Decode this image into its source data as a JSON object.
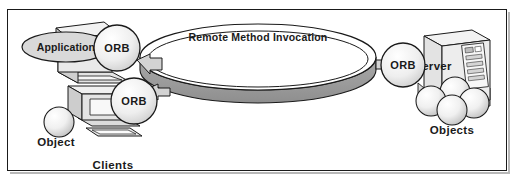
{
  "figure": {
    "title": "Remote Method Invocation",
    "border_color": "#1a1a1a",
    "background_color": "#ffffff",
    "shadow_color": "#b8b8b8"
  },
  "ring": {
    "label": "Remote Method Invocation",
    "top_fill": "#ffffff",
    "band_fill": "#9c9c9c",
    "stroke": "#1a1a1a"
  },
  "clients": {
    "group_label": "Clients",
    "application": {
      "label": "Application",
      "fill": "#d9d9d9",
      "stroke": "#1a1a1a"
    },
    "laptop_orb": {
      "label": "ORB",
      "fill": "#ececec",
      "stroke": "#1a1a1a"
    },
    "desktop_orb": {
      "label": "ORB",
      "fill": "#ececec",
      "stroke": "#1a1a1a"
    },
    "object": {
      "label": "Object",
      "fill": "#efefef",
      "stroke": "#1a1a1a"
    }
  },
  "server_side": {
    "orb": {
      "label": "ORB",
      "fill": "#ececec",
      "stroke": "#1a1a1a"
    },
    "server": {
      "label": "Server",
      "fill": "#e6e6e6",
      "stroke": "#1a1a1a"
    },
    "objects": {
      "label": "Objects",
      "fill": "#efefef",
      "stroke": "#1a1a1a"
    }
  }
}
